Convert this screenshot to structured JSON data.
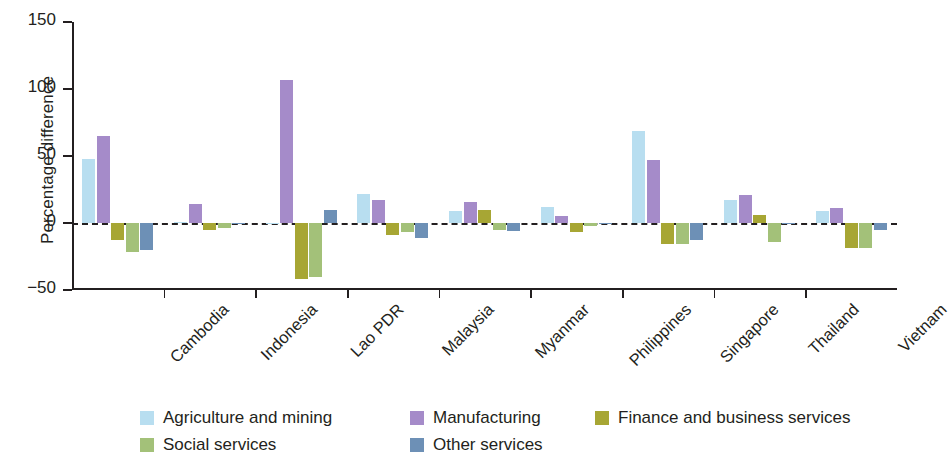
{
  "chart_data": {
    "type": "bar",
    "title": "",
    "subtitle": "",
    "xlabel": "",
    "ylabel": "Percentage difference",
    "ylim": [
      -50,
      150
    ],
    "yticks": [
      -50,
      0,
      50,
      100,
      150
    ],
    "ytick_labels": [
      "−50",
      "0",
      "50",
      "100",
      "150"
    ],
    "grid": false,
    "zero_line": true,
    "legend_position": "bottom",
    "orientation": "vertical",
    "categories": [
      "Cambodia",
      "Indonesia",
      "Lao PDR",
      "Malaysia",
      "Myanmar",
      "Philippines",
      "Singapore",
      "Thailand",
      "Vietnam"
    ],
    "series": [
      {
        "name": "Agriculture and mining",
        "color": "#b8def0",
        "values": [
          48,
          1,
          -1,
          22,
          9,
          12,
          69,
          17,
          9
        ]
      },
      {
        "name": "Manufacturing",
        "color": "#a58bc9",
        "values": [
          65,
          14,
          107,
          17,
          16,
          5,
          47,
          21,
          11
        ]
      },
      {
        "name": "Finance and business services",
        "color": "#a7a634",
        "values": [
          -13,
          -5,
          -42,
          -9,
          10,
          -7,
          -16,
          6,
          -19
        ]
      },
      {
        "name": "Social services",
        "color": "#a3c179",
        "values": [
          -22,
          -4,
          -40,
          -7,
          -5,
          -2,
          -16,
          -14,
          -19
        ]
      },
      {
        "name": "Other services",
        "color": "#6d90b6",
        "values": [
          -20,
          -1,
          10,
          -11,
          -6,
          -1,
          -13,
          -1,
          -5
        ]
      }
    ]
  },
  "legend": {
    "items": [
      {
        "label": "Agriculture and mining",
        "color": "#b8def0"
      },
      {
        "label": "Manufacturing",
        "color": "#a58bc9"
      },
      {
        "label": "Finance and business services",
        "color": "#a7a634"
      },
      {
        "label": "Social services",
        "color": "#a3c179"
      },
      {
        "label": "Other services",
        "color": "#6d90b6"
      }
    ]
  },
  "axis": {
    "y_title": "Percentage difference",
    "y_tick_labels": [
      "150",
      "100",
      "50",
      "0",
      "−50"
    ]
  },
  "colors": {
    "axis": "#231f20",
    "text": "#231f20",
    "background": "#ffffff"
  }
}
